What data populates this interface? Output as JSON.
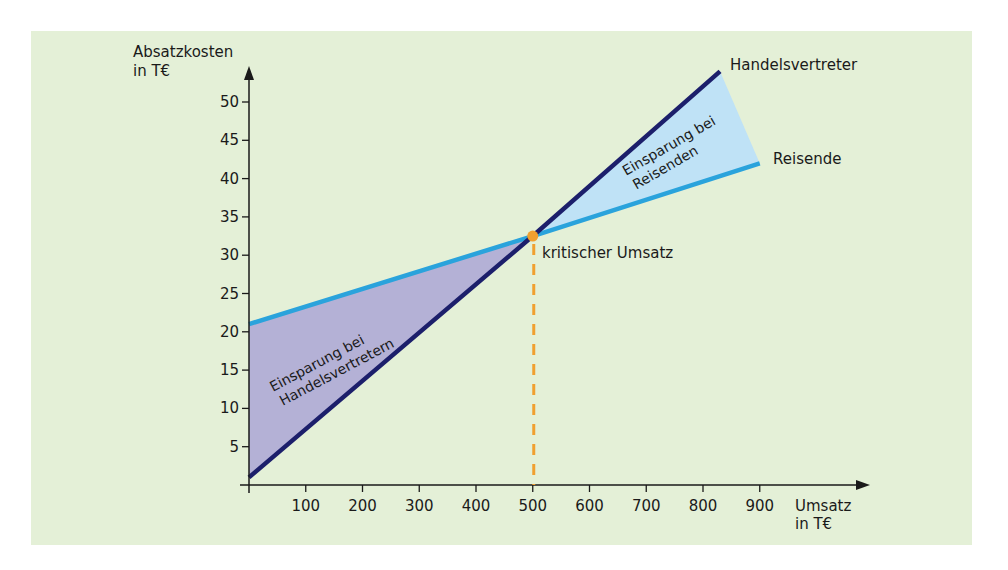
{
  "colors": {
    "background": "#e4f0d7",
    "axis": "#1a1a1a",
    "handelsvertreter_line": "#1c1f6b",
    "reisende_line": "#2aa3dc",
    "savings_handelsvertreter_fill": "#b4b1d6",
    "savings_reisende_fill": "#bfe2f6",
    "critical_point": "#f0a030"
  },
  "labels": {
    "y_axis_line1": "Absatzkosten",
    "y_axis_line2": "in T€",
    "x_axis_line1": "Umsatz",
    "x_axis_line2": "in T€",
    "series_handelsvertreter": "Handelsvertreter",
    "series_reisende": "Reisende",
    "critical_point": "kritischer Umsatz",
    "area_handelsvertreter_line1": "Einsparung bei",
    "area_handelsvertreter_line2": "Handelsvertretern",
    "area_reisende_line1": "Einsparung bei",
    "area_reisende_line2": "Reisenden"
  },
  "chart_data": {
    "type": "line",
    "title": "",
    "xlabel": "Umsatz in T€",
    "ylabel": "Absatzkosten in T€",
    "x_ticks": [
      100,
      200,
      300,
      400,
      500,
      600,
      700,
      800,
      900
    ],
    "y_ticks": [
      5,
      10,
      15,
      20,
      25,
      30,
      35,
      40,
      45,
      50
    ],
    "xlim": [
      0,
      1000
    ],
    "ylim": [
      0,
      55
    ],
    "grid": false,
    "legend": "inline labels at line ends",
    "series": [
      {
        "name": "Handelsvertreter",
        "x": [
          0,
          500,
          830
        ],
        "values": [
          1,
          32.5,
          54
        ]
      },
      {
        "name": "Reisende",
        "x": [
          0,
          500,
          900
        ],
        "values": [
          21,
          32.5,
          42
        ]
      }
    ],
    "annotations": [
      {
        "type": "point",
        "label": "kritischer Umsatz",
        "x": 500,
        "y": 32.5
      },
      {
        "type": "vline-dashed",
        "x": 500,
        "from_y": 0,
        "to_y": 32.5
      },
      {
        "type": "area",
        "label": "Einsparung bei Handelsvertretern",
        "x_range": [
          0,
          500
        ]
      },
      {
        "type": "area",
        "label": "Einsparung bei Reisenden",
        "x_range": [
          500,
          900
        ]
      }
    ]
  }
}
